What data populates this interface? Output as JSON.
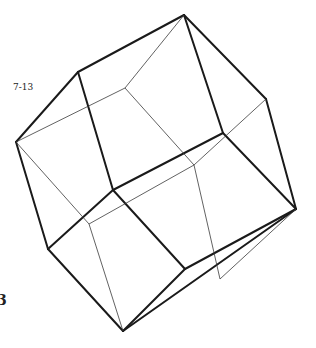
{
  "figure": {
    "label": "7-13",
    "edge_mark": "3",
    "colors": {
      "heavy": "#1a1a1a",
      "thin": "#3a3a3a",
      "background": "#ffffff"
    },
    "vertices": {
      "A": [
        184,
        15
      ],
      "B": [
        78,
        72
      ],
      "C": [
        16,
        142
      ],
      "D": [
        266,
        99
      ],
      "E": [
        223,
        133
      ],
      "F": [
        113,
        190
      ],
      "G": [
        296,
        209
      ],
      "H": [
        48,
        249
      ],
      "I": [
        185,
        269
      ],
      "J": [
        123,
        331
      ],
      "K": [
        125,
        88
      ],
      "L": [
        194,
        165
      ],
      "M": [
        89,
        224
      ],
      "N": [
        220,
        279
      ]
    }
  }
}
